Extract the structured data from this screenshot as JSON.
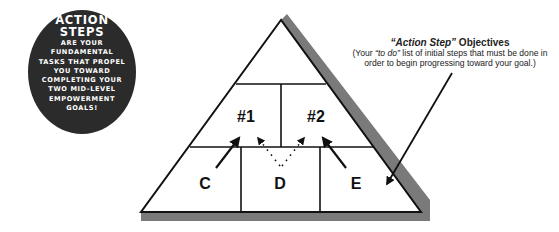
{
  "badge": {
    "title_line1": "ACTION",
    "title_line2": "STEPS",
    "body_lines": [
      "ARE YOUR",
      "FUNDAMENTAL",
      "TASKS THAT PROPEL",
      "YOU TOWARD",
      "COMPLETING YOUR",
      "TWO MID-LEVEL",
      "EMPOWERMENT",
      "GOALS!"
    ]
  },
  "callout": {
    "title_quoted": "“Action Step”",
    "title_rest": " Objectives",
    "body_prefix": "(Your ",
    "body_quoted": "“to do”",
    "body_line1_rest": " list of initial steps that must be done in",
    "body_line2": "order to begin progressing toward your goal.)"
  },
  "pyramid": {
    "goals": [
      "#1",
      "#2"
    ],
    "steps": [
      "C",
      "D",
      "E"
    ]
  },
  "colors": {
    "badge_fill": "#2b2b2b",
    "shadow": "#7a7a7a",
    "outline": "#111111",
    "background": "#ffffff"
  }
}
